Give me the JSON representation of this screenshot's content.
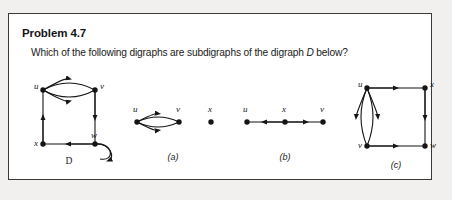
{
  "page": {
    "background_color": "#f2f0ee",
    "card_background": "#ffffff",
    "border_color": "#3a3a3a",
    "ink_color": "#151515"
  },
  "problem": {
    "title": "Problem 4.7",
    "question_prefix": "Which of the following digraphs are subdigraphs of the digraph ",
    "question_italic": "D",
    "question_suffix": " below?"
  },
  "figures": [
    {
      "id": "digraph-D",
      "caption": "D",
      "caption_style": "italic-serif",
      "vertices": [
        {
          "name": "u",
          "label": "u",
          "x": 22,
          "y": 14,
          "label_side": "left"
        },
        {
          "name": "v",
          "label": "v",
          "x": 74,
          "y": 14,
          "label_side": "right"
        },
        {
          "name": "x",
          "label": "x",
          "x": 22,
          "y": 68,
          "label_side": "left"
        },
        {
          "name": "w",
          "label": "w",
          "x": 74,
          "y": 68,
          "label_side": "right"
        }
      ],
      "edges": [
        {
          "from": "u",
          "to": "v",
          "type": "arc-upper",
          "direction": "right"
        },
        {
          "from": "u",
          "to": "v",
          "type": "arc-lower",
          "direction": "right"
        },
        {
          "from": "x",
          "to": "u",
          "type": "straight",
          "direction": "up"
        },
        {
          "from": "v",
          "to": "w",
          "type": "straight",
          "direction": "down"
        },
        {
          "from": "w",
          "to": "x",
          "type": "straight",
          "direction": "left"
        },
        {
          "from": "w",
          "to": "w",
          "type": "self-loop",
          "direction": "clockwise"
        }
      ]
    },
    {
      "id": "choice-a",
      "caption": "(a)",
      "caption_style": "plain",
      "vertices": [
        {
          "name": "u",
          "label": "u",
          "x": 10,
          "y": 20,
          "label_side": "above-left"
        },
        {
          "name": "v",
          "label": "v",
          "x": 52,
          "y": 20,
          "label_side": "above-right"
        },
        {
          "name": "x",
          "label": "x",
          "x": 84,
          "y": 20,
          "label_side": "above"
        }
      ],
      "edges": [
        {
          "from": "u",
          "to": "v",
          "type": "arc-upper",
          "direction": "right"
        },
        {
          "from": "u",
          "to": "v",
          "type": "arc-lower",
          "direction": "right"
        }
      ]
    },
    {
      "id": "choice-b",
      "caption": "(b)",
      "caption_style": "plain",
      "vertices": [
        {
          "name": "u",
          "label": "u",
          "x": 10,
          "y": 20,
          "label_side": "above"
        },
        {
          "name": "x",
          "label": "x",
          "x": 48,
          "y": 20,
          "label_side": "above"
        },
        {
          "name": "v",
          "label": "v",
          "x": 86,
          "y": 20,
          "label_side": "above"
        }
      ],
      "edges": [
        {
          "from": "x",
          "to": "u",
          "type": "straight",
          "direction": "left"
        },
        {
          "from": "x",
          "to": "v",
          "type": "straight",
          "direction": "right"
        }
      ]
    },
    {
      "id": "choice-c",
      "caption": "(c)",
      "caption_style": "plain",
      "vertices": [
        {
          "name": "u",
          "label": "u",
          "x": 14,
          "y": 12,
          "label_side": "left"
        },
        {
          "name": "x",
          "label": "x",
          "x": 72,
          "y": 12,
          "label_side": "right"
        },
        {
          "name": "v",
          "label": "v",
          "x": 14,
          "y": 70,
          "label_side": "left"
        },
        {
          "name": "w",
          "label": "w",
          "x": 72,
          "y": 70,
          "label_side": "right"
        }
      ],
      "edges": [
        {
          "from": "u",
          "to": "x",
          "type": "straight",
          "direction": "right"
        },
        {
          "from": "x",
          "to": "w",
          "type": "straight",
          "direction": "down"
        },
        {
          "from": "v",
          "to": "w",
          "type": "straight",
          "direction": "right"
        },
        {
          "from": "u",
          "to": "v",
          "type": "arc-left",
          "direction": "down"
        },
        {
          "from": "u",
          "to": "v",
          "type": "arc-right",
          "direction": "down"
        }
      ]
    }
  ]
}
